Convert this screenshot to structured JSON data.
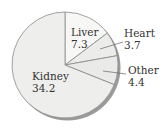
{
  "chart_data": {
    "type": "pie",
    "title": "",
    "categories": [
      "Liver",
      "Heart",
      "Other",
      "Kidney"
    ],
    "values": [
      7.3,
      3.7,
      4.4,
      34.2
    ],
    "colors": [
      "#f7f7f5",
      "#ececea",
      "#eaeae8",
      "#eeeeec"
    ],
    "start_angle_deg": 0,
    "direction": "clockwise",
    "shadow": true,
    "legend": "none",
    "labels": [
      {
        "name": "Liver",
        "value": "7.3"
      },
      {
        "name": "Heart",
        "value": "3.7"
      },
      {
        "name": "Other",
        "value": "4.4"
      },
      {
        "name": "Kidney",
        "value": "34.2"
      }
    ]
  }
}
